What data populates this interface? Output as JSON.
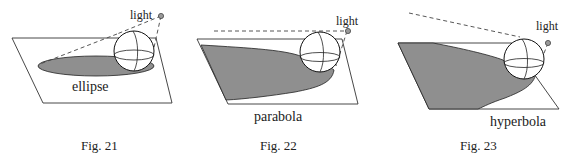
{
  "figures": [
    {
      "id": "fig21",
      "caption": "Fig. 21",
      "conic_label": "ellipse",
      "light_label": "light"
    },
    {
      "id": "fig22",
      "caption": "Fig. 22",
      "conic_label": "parabola",
      "light_label": "light"
    },
    {
      "id": "fig23",
      "caption": "Fig. 23",
      "conic_label": "hyperbola",
      "light_label": "light"
    }
  ],
  "colors": {
    "shadow": "#8f8f8f",
    "line": "#333333",
    "background": "#ffffff"
  }
}
